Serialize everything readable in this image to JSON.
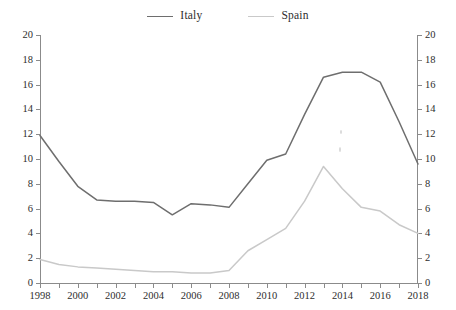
{
  "legend": {
    "position": "top-center",
    "entries": [
      {
        "label": "Italy",
        "color": "#6e6e6e",
        "swatch_name": "legend-swatch-italy"
      },
      {
        "label": "Spain",
        "color": "#c9c9c9",
        "swatch_name": "legend-swatch-spain"
      }
    ]
  },
  "chart_data": {
    "type": "line",
    "title": "",
    "subtitle": "",
    "xlabel": "",
    "ylabel": "",
    "xlim": [
      1998,
      2018
    ],
    "ylim": [
      0,
      20
    ],
    "ytick_step": 2,
    "xtick_step": 1,
    "xtick_label_step": 2,
    "grid": false,
    "dual_y_axis": true,
    "y_left_ticks": [
      0,
      2,
      4,
      6,
      8,
      10,
      12,
      14,
      16,
      18,
      20
    ],
    "y_right_ticks": [
      0,
      2,
      4,
      6,
      8,
      10,
      12,
      14,
      16,
      18,
      20
    ],
    "x": [
      1998,
      1999,
      2000,
      2001,
      2002,
      2003,
      2004,
      2005,
      2006,
      2007,
      2008,
      2009,
      2010,
      2011,
      2012,
      2013,
      2014,
      2015,
      2016,
      2017,
      2018
    ],
    "xtick_labels": [
      "1998",
      "",
      "2000",
      "",
      "2002",
      "",
      "2004",
      "",
      "2006",
      "",
      "2008",
      "",
      "2010",
      "",
      "2012",
      "",
      "2014",
      "",
      "2016",
      "",
      "2018"
    ],
    "series": [
      {
        "name": "Italy",
        "color": "#6e6e6e",
        "values": [
          11.9,
          9.8,
          7.8,
          6.7,
          6.6,
          6.6,
          6.5,
          5.5,
          6.4,
          6.3,
          6.1,
          8.0,
          9.9,
          10.4,
          13.6,
          16.6,
          17.0,
          17.0,
          16.2,
          13.0,
          9.6
        ]
      },
      {
        "name": "Spain",
        "color": "#c9c9c9",
        "values": [
          1.9,
          1.5,
          1.3,
          1.2,
          1.1,
          1.0,
          0.9,
          0.9,
          0.8,
          0.8,
          1.0,
          2.6,
          3.5,
          4.4,
          6.6,
          9.4,
          7.6,
          6.1,
          5.8,
          4.7,
          4.0
        ]
      }
    ]
  }
}
